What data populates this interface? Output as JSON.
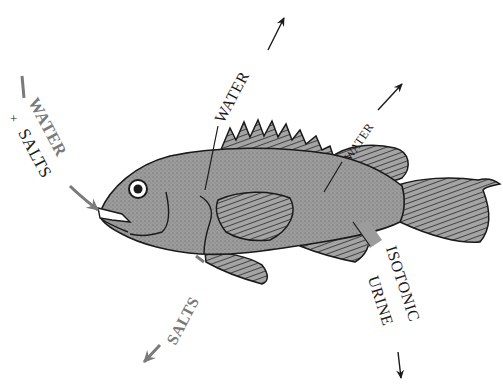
{
  "diagram": {
    "colors": {
      "body": "#9c9c9c",
      "outline": "#1a1a1a",
      "arrow_gray": "#7a7a7a",
      "arrow_black": "#1a1a1a",
      "background": "#ffffff"
    },
    "labels": {
      "intake_water": "WATER",
      "intake_plus": "+",
      "intake_salts": "SALTS",
      "gill_water_out": "WATER",
      "body_water_out": "WATER",
      "gill_salts_out": "SALTS",
      "urine_line1": "ISOTONIC",
      "urine_line2": "URINE",
      "intake_minus": "—"
    },
    "flows": [
      {
        "id": "intake",
        "label": "WATER + SALTS",
        "direction": "in",
        "via": "mouth",
        "color": "gray"
      },
      {
        "id": "gill-water",
        "label": "WATER",
        "direction": "out",
        "via": "gills",
        "color": "black"
      },
      {
        "id": "body-water",
        "label": "WATER",
        "direction": "out",
        "via": "body surface",
        "color": "black"
      },
      {
        "id": "salts-out",
        "label": "SALTS",
        "direction": "out",
        "via": "gills",
        "color": "gray"
      },
      {
        "id": "urine",
        "label": "ISOTONIC URINE",
        "direction": "out",
        "via": "kidney",
        "color": "black"
      }
    ]
  }
}
